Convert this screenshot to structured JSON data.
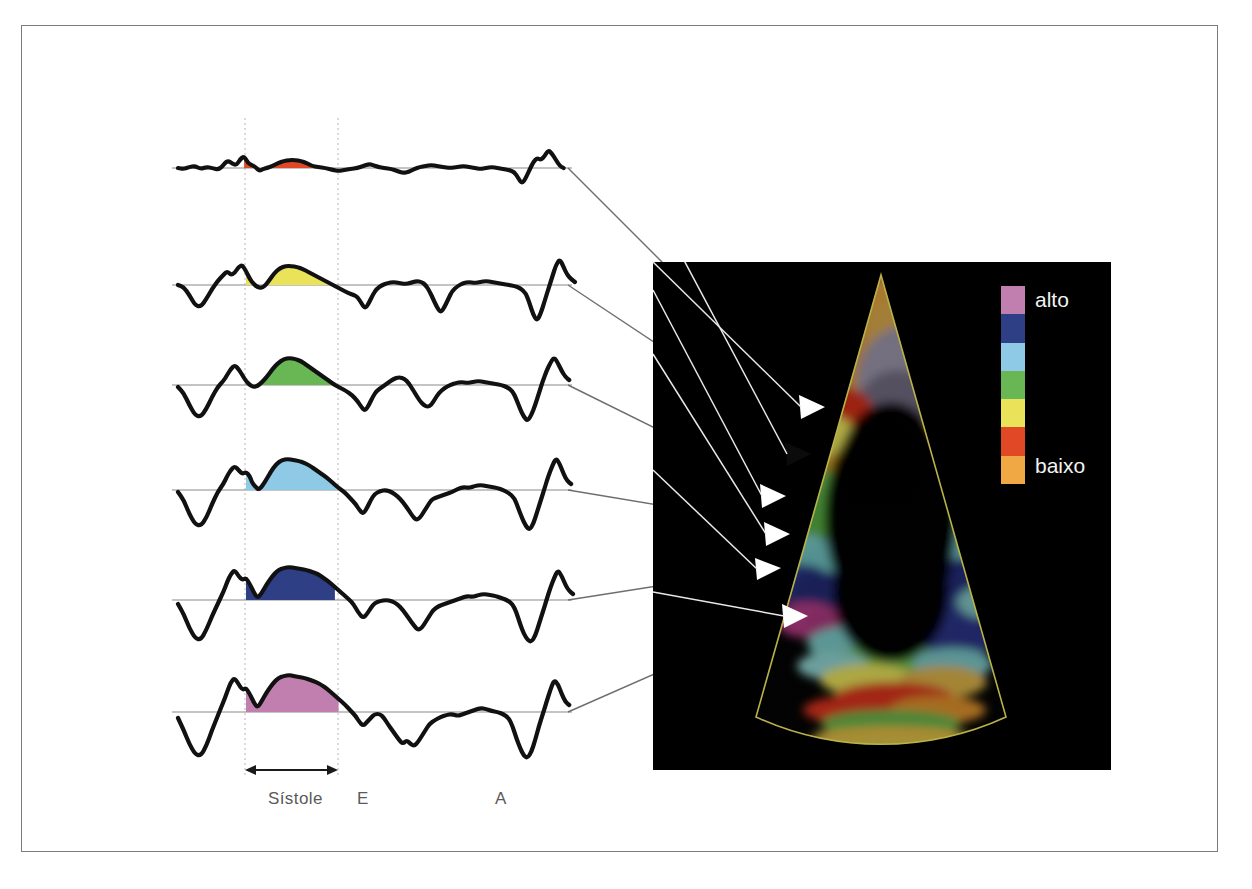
{
  "figure": {
    "border_color": "#7c7c7c",
    "background": "#ffffff"
  },
  "axis": {
    "labels": [
      {
        "id": "sistole",
        "text": "Sístole"
      },
      {
        "id": "e",
        "text": "E"
      },
      {
        "id": "a",
        "text": "A"
      }
    ],
    "systole_marker": "double-headed-arrow",
    "gridline_color": "#c8c8c8",
    "baseline_color": "#8a8a8a"
  },
  "legend": {
    "high_label": "alto",
    "low_label": "baixo",
    "colors": [
      "#c07fae",
      "#2e3f86",
      "#8ecae6",
      "#68b754",
      "#eae35a",
      "#e04826",
      "#f0a845"
    ]
  },
  "ultrasound": {
    "panel_background": "#000000",
    "sector_outline_color": "#b9b24a",
    "arrow_colors": [
      "#ffffff",
      "#000000",
      "#ffffff",
      "#ffffff",
      "#ffffff",
      "#ffffff"
    ],
    "connector_color": "#8f8f8f",
    "description": "Apical four-chamber tissue Doppler color map"
  },
  "chart_data": {
    "type": "line",
    "xlabel": "",
    "ylabel": "",
    "grid": true,
    "legend_position": "none",
    "annotations": [
      "Sístole",
      "E",
      "A"
    ],
    "event_markers": {
      "systole_start": 245,
      "systole_end": 338,
      "E_peak": 362,
      "A_peak": 500
    },
    "series": [
      {
        "name": "segmento-1",
        "fill_color": "#e04826",
        "stroke_color": "#111111",
        "baseline_y": 168,
        "systolic_peak_amplitude": 7,
        "points": "0,0 6,-1 12,1 18,2 24,-1 30,1 36,0 44,-2 52,8 58,4 62,3 66,9 70,12 74,5 78,3 82,1 86,-3 90,-1 94,0 100,2 106,5 112,7 118,8 124,8 130,7 136,5 142,2 148,1 156,0 164,-2 170,-3 176,-2 182,-1 190,0 196,2 202,4 206,3 212,1 218,0 226,-1 232,-3 238,-5 244,-4 250,-1 256,1 262,2 268,3 274,2 280,1 288,0 296,1 302,2 308,1 314,0 320,-1 326,0 332,1 338,0 344,-1 350,-2 356,-4 360,-10 364,-16 368,-10 372,-2 376,6 380,10 384,8 388,12 392,18 396,14 400,8 404,2 408,0",
        "arrow_target": "red-segment-basal-septal"
      },
      {
        "name": "segmento-2",
        "fill_color": "#eae35a",
        "stroke_color": "#111111",
        "baseline_y": 285,
        "systolic_peak_amplitude": 19,
        "points": "0,0 6,-2 12,-10 18,-20 24,-22 30,-14 36,-4 42,4 48,10 52,14 56,10 60,12 64,18 68,20 72,14 76,6 80,1 84,-2 88,-3 92,-1 96,4 102,12 108,17 114,19 120,19 126,18 132,16 138,13 144,10 150,7 156,4 162,1 168,-2 174,-5 180,-8 186,-10 190,-12 194,-18 198,-24 202,-18 206,-10 210,-4 216,0 222,2 228,3 234,2 240,1 246,2 252,4 258,3 262,0 266,-6 270,-14 274,-22 278,-28 282,-22 286,-14 290,-6 296,-1 302,2 308,3 314,2 320,3 326,4 332,3 338,2 344,1 350,0 356,-1 362,-3 368,-8 372,-18 376,-30 380,-36 384,-28 388,-16 392,-4 396,8 400,20 404,26 408,18 412,10 416,6 420,3",
        "arrow_target": "yellow-segment-mid-septal"
      },
      {
        "name": "segmento-3",
        "fill_color": "#68b754",
        "stroke_color": "#111111",
        "baseline_y": 385,
        "systolic_peak_amplitude": 26,
        "points": "0,-2 6,-8 12,-20 18,-30 24,-32 30,-24 36,-12 42,-2 48,4 52,10 56,16 60,20 64,16 68,10 72,4 76,0 80,-2 84,-1 88,2 94,8 100,16 106,22 112,26 118,27 124,26 130,24 136,20 142,16 148,12 154,8 160,4 166,0 172,-3 178,-6 184,-10 190,-16 194,-22 198,-26 202,-20 206,-12 210,-6 216,-2 222,2 228,6 234,8 240,6 244,2 248,-4 252,-10 256,-16 260,-20 264,-22 268,-20 272,-14 276,-8 282,-3 288,0 294,2 300,3 306,2 312,3 318,4 324,3 330,2 336,1 342,0 348,-2 354,-6 358,-14 362,-24 366,-32 370,-36 374,-30 378,-20 382,-8 386,4 390,14 394,22 398,28 402,22 406,14 410,8 414,5",
        "arrow_target": "green-segment-apical-septal"
      },
      {
        "name": "segmento-4",
        "fill_color": "#8ecae6",
        "stroke_color": "#111111",
        "baseline_y": 490,
        "systolic_peak_amplitude": 30,
        "points": "0,-2 6,-10 12,-24 18,-34 24,-36 30,-28 36,-14 42,-2 48,6 52,14 56,20 60,24 64,20 68,16 72,18 76,14 78,8 82,3 86,0 92,8 98,18 104,26 110,30 116,31 122,30 128,29 134,27 140,24 146,20 152,16 158,12 164,7 170,2 176,-2 182,-8 188,-14 192,-20 196,-24 200,-18 204,-10 208,-4 214,-1 220,0 226,-2 232,-6 238,-12 244,-20 248,-26 252,-30 256,-28 260,-22 264,-16 268,-10 272,-8 278,-6 284,-4 290,-2 296,1 302,3 308,2 314,4 320,5 326,4 332,3 338,2 344,0 350,-3 356,-8 360,-18 364,-28 368,-36 372,-40 376,-34 380,-22 384,-10 388,2 392,14 396,24 400,32 404,26 408,16 412,9 416,6",
        "arrow_target": "lightblue-segment-basal-lateral"
      },
      {
        "name": "segmento-5",
        "fill_color": "#2e3f86",
        "stroke_color": "#111111",
        "baseline_y": 600,
        "systolic_peak_amplitude": 32,
        "points": "0,-4 6,-14 12,-28 18,-38 24,-40 30,-30 36,-16 42,-4 48,8 52,18 56,26 60,30 64,24 68,20 72,22 76,16 80,8 84,2 88,6 94,16 100,24 106,30 112,32 118,33 124,32 130,31 136,30 142,28 148,26 154,22 160,18 166,13 172,8 178,3 184,-2 188,-8 192,-14 196,-18 200,-14 204,-8 208,-3 214,-1 220,0 226,-1 232,-4 238,-10 244,-18 250,-26 254,-30 258,-28 262,-22 266,-16 270,-10 276,-6 282,-4 288,-2 294,0 300,2 306,4 312,3 318,5 324,6 330,5 336,4 342,2 348,0 354,-4 358,-12 362,-24 366,-34 370,-40 374,-42 378,-36 382,-24 386,-12 390,0 394,12 398,22 402,30 406,24 410,15 414,9 418,6",
        "arrow_target": "darkblue-segment-mid-lateral"
      },
      {
        "name": "segmento-6",
        "fill_color": "#c07fae",
        "stroke_color": "#111111",
        "baseline_y": 712,
        "systolic_peak_amplitude": 36,
        "points": "0,-6 6,-18 12,-32 18,-42 24,-44 30,-34 36,-18 42,-4 48,10 52,20 56,30 60,34 64,28 68,22 72,24 76,18 80,10 84,4 88,10 94,20 100,28 106,34 112,36 118,37 122,36 128,35 134,34 140,32 146,30 152,27 158,23 164,18 170,13 176,8 182,2 188,-4 192,-10 196,-14 200,-10 204,-6 208,-2 214,-2 218,-6 222,-12 228,-20 234,-28 238,-32 242,-28 246,-32 250,-34 254,-30 258,-24 262,-18 266,-12 272,-8 278,-5 284,-3 290,-2 296,-4 302,-2 308,0 314,2 320,4 326,3 332,1 338,0 344,-2 350,-6 354,-14 358,-26 362,-36 366,-44 370,-46 374,-40 378,-28 382,-14 386,-2 390,10 394,22 398,32 402,28 406,18 410,10 414,7",
        "arrow_target": "magenta-segment-apical-lateral"
      }
    ]
  }
}
